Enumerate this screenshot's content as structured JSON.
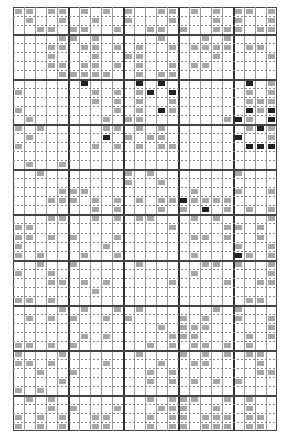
{
  "document": {
    "title": "",
    "description": "Scanned dense grid table with illegible small cell entries"
  },
  "grid": {
    "columns": 24,
    "rows": 47,
    "col_width": 11,
    "row_height": 9.02,
    "thick_col_every": 5,
    "thick_col_positions": [
      0,
      5,
      10,
      15,
      20
    ],
    "thick_row_positions": [
      0,
      3,
      8,
      13,
      18,
      23,
      28,
      33,
      38,
      43
    ],
    "legend": {
      "0": "empty",
      "1": "light entry",
      "2": "dark entry"
    },
    "cells": [
      "110110101010011010101101",
      "010010010010001000101001",
      "001101100100110100111011",
      "000011010000010001010000",
      "000110110101001011110110",
      "000100010011000000100001",
      "000110110101001011000000",
      "000011111001011000000000",
      "000000200002020000000201",
      "100000010101202000000101",
      "000000010101001000000111",
      "100000000101021000000212",
      "010000001011000000012102",
      "101000001101010000000121",
      "010000002010110000002001",
      "100000010101011000000222",
      "000000000000000000000000",
      "010010000000000000000000",
      "001000000010100000001000",
      "000000000010010000000000",
      "000011100000000010001001",
      "000111010101011211110000",
      "000000010100010102010101",
      "000110010101100010100001",
      "110000000000001000011010",
      "110101000100000011010010",
      "100000001000000000001001",
      "101000100100000010002101",
      "001001000001000001101001",
      "100100000000000010000001",
      "000110101000001000010011",
      "000000010000000000000000",
      "110100000000000000000110",
      "000010100101000000101000",
      "010101001010000101001001",
      "000000000000010111000001",
      "000000101000001110000101",
      "110101000000101011010100",
      "100010000001000101010110",
      "110100001000010011000010",
      "001001000000101000000011",
      "000010000000101010101000",
      "101000000000000000000000",
      "010100000000101110010100",
      "000101000100011100100100",
      "101010011000101101110110",
      "101010011000101101110110"
    ]
  }
}
